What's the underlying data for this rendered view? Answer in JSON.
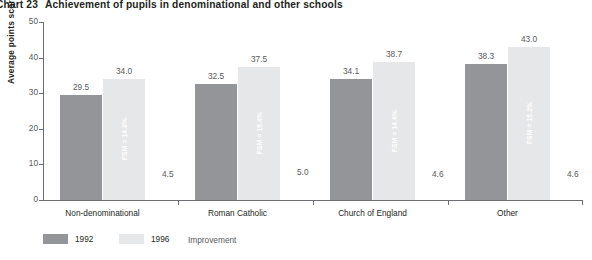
{
  "title": {
    "number": "Chart 23",
    "text": "Achievement of pupils in denominational and other schools"
  },
  "chart_data": {
    "type": "bar",
    "xlabel": "",
    "ylabel": "Average points score",
    "ylim": [
      0,
      50
    ],
    "yticks": [
      0,
      10,
      20,
      30,
      40,
      50
    ],
    "grid": false,
    "legend_position": "bottom-left",
    "categories": [
      "Non-denominational",
      "Roman Catholic",
      "Church of England",
      "Other"
    ],
    "series": [
      {
        "name": "1992",
        "color": "#939598",
        "values": [
          29.5,
          32.5,
          34.1,
          38.3
        ]
      },
      {
        "name": "1996",
        "color": "#e6e7e8",
        "values": [
          34.0,
          37.5,
          38.7,
          43.0
        ]
      }
    ],
    "annotations": {
      "improvement_label": "Improvement",
      "improvement": [
        4.5,
        5.0,
        4.6,
        4.6
      ],
      "fsm": [
        "FSM = 14.8%",
        "FSM = 19.4%",
        "FSM = 14.6%",
        "FSM = 15.2%"
      ]
    }
  },
  "axis": {
    "y_title": "Average points score",
    "y_ticks": [
      "0",
      "10",
      "20",
      "30",
      "40",
      "50"
    ]
  },
  "categories": [
    {
      "label": "Non-denominational",
      "v1992": "29.5",
      "v1996": "34.0",
      "improvement": "4.5",
      "fsm": "FSM = 14.8%"
    },
    {
      "label": "Roman Catholic",
      "v1992": "32.5",
      "v1996": "37.5",
      "improvement": "5.0",
      "fsm": "FSM = 19.4%"
    },
    {
      "label": "Church of England",
      "v1992": "34.1",
      "v1996": "38.7",
      "improvement": "4.6",
      "fsm": "FSM = 14.6%"
    },
    {
      "label": "Other",
      "v1992": "38.3",
      "v1996": "43.0",
      "improvement": "4.6",
      "fsm": "FSM = 15.2%"
    }
  ],
  "legend": {
    "items": [
      {
        "label": "1992",
        "color": "#939598"
      },
      {
        "label": "1996",
        "color": "#e6e7e8"
      }
    ],
    "note": "Improvement"
  },
  "colors": {
    "bar_1992": "#939598",
    "bar_1996": "#e6e7e8",
    "axis": "#6d6e71",
    "text": "#231f20",
    "muted_text": "#58595b"
  }
}
